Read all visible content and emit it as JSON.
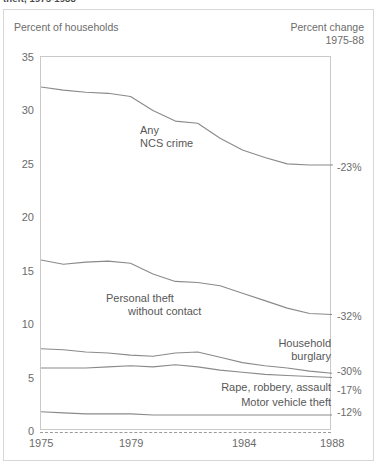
{
  "caption": {
    "text": "theft, 1975-1988"
  },
  "header": {
    "left_label": "Percent of households",
    "right_label_line1": "Percent change",
    "right_label_line2": "1975-88"
  },
  "annotations": {
    "any_ncs_crime_line1": "Any",
    "any_ncs_crime_line2": "NCS crime",
    "personal_theft_line1": "Personal theft",
    "personal_theft_line2": "without contact",
    "household_burglary_line1": "Household",
    "household_burglary_line2": "burglary",
    "rape_robbery_assault": "Rape, robbery, assault",
    "motor_vehicle_theft": "Motor vehicle theft"
  },
  "change_labels": {
    "any_ncs_crime": "-23%",
    "personal_theft": "-32%",
    "household_burglary": "-30%",
    "rape_robbery_assault": "-17%",
    "motor_vehicle_theft": "-12%"
  },
  "axis": {
    "y_ticks": [
      "35",
      "30",
      "25",
      "20",
      "15",
      "10",
      "5",
      "0"
    ],
    "x_ticks": [
      "1975",
      "1979",
      "1984",
      "1988"
    ]
  },
  "colors": {
    "line": "#8a8a8a",
    "frame": "#c9c9c9",
    "text": "#6b6b6b",
    "background": "#ffffff"
  },
  "chart_data": {
    "type": "line",
    "title": "theft, 1975-1988",
    "xlabel": "",
    "ylabel": "Percent of households",
    "xlim": [
      1975,
      1988
    ],
    "ylim": [
      0,
      35
    ],
    "grid": false,
    "legend": "inline-annotations",
    "x": [
      1975,
      1976,
      1977,
      1978,
      1979,
      1980,
      1981,
      1982,
      1983,
      1984,
      1985,
      1986,
      1987,
      1988
    ],
    "series": [
      {
        "name": "Any NCS crime",
        "label_line1": "Any",
        "label_line2": "NCS crime",
        "percent_change": "-23%",
        "values": [
          32.2,
          31.9,
          31.7,
          31.6,
          31.3,
          30.0,
          29.0,
          28.8,
          27.4,
          26.3,
          25.6,
          25.0,
          24.9,
          24.9
        ]
      },
      {
        "name": "Personal theft without contact",
        "label_line1": "Personal theft",
        "label_line2": "without contact",
        "percent_change": "-32%",
        "values": [
          16.0,
          15.6,
          15.8,
          15.9,
          15.7,
          14.7,
          14.0,
          13.9,
          13.6,
          12.9,
          12.2,
          11.5,
          11.0,
          10.9
        ]
      },
      {
        "name": "Household burglary",
        "label_line1": "Household",
        "label_line2": "burglary",
        "percent_change": "-30%",
        "values": [
          7.7,
          7.6,
          7.4,
          7.3,
          7.1,
          7.0,
          7.3,
          7.4,
          6.9,
          6.4,
          6.1,
          5.9,
          5.6,
          5.4
        ]
      },
      {
        "name": "Rape, robbery, assault",
        "label": "Rape, robbery, assault",
        "percent_change": "-17%",
        "values": [
          5.9,
          5.9,
          5.9,
          6.0,
          6.1,
          6.0,
          6.2,
          6.0,
          5.7,
          5.5,
          5.3,
          5.2,
          5.1,
          5.0
        ]
      },
      {
        "name": "Motor vehicle theft",
        "label": "Motor vehicle theft",
        "percent_change": "-12%",
        "values": [
          1.8,
          1.7,
          1.6,
          1.6,
          1.6,
          1.5,
          1.5,
          1.5,
          1.5,
          1.5,
          1.5,
          1.5,
          1.5,
          1.5
        ]
      }
    ]
  }
}
